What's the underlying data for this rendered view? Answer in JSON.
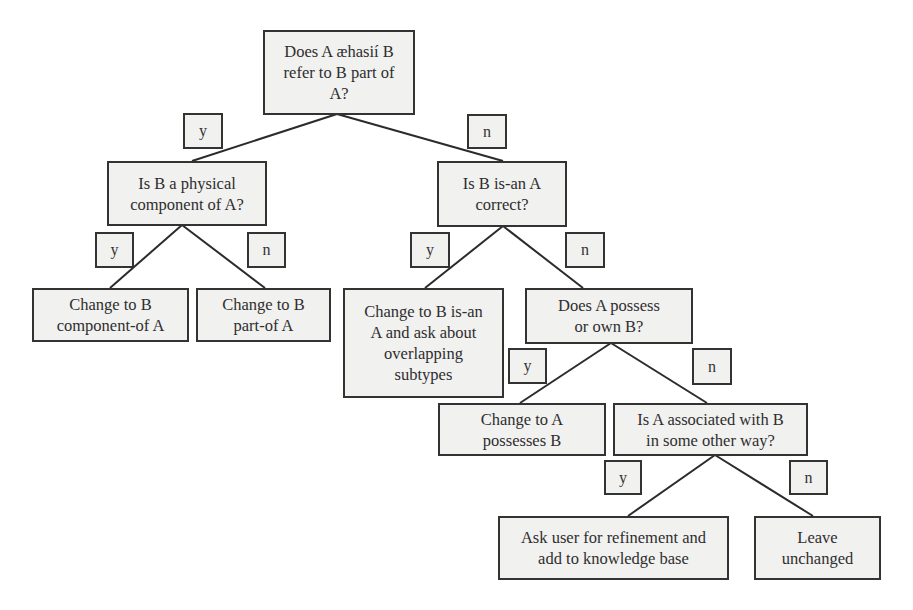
{
  "diagram": {
    "type": "decision-tree",
    "nodes": {
      "root": {
        "text": "Does A æhasií B\nrefer to B part of\nA?",
        "kind": "question"
      },
      "physical": {
        "text": "Is B a physical\ncomponent of A?",
        "kind": "question"
      },
      "isan": {
        "text": "Is B is-an A\ncorrect?",
        "kind": "question"
      },
      "component_of": {
        "text": "Change to B\ncomponent-of A",
        "kind": "action"
      },
      "part_of": {
        "text": "Change to B\npart-of A",
        "kind": "action"
      },
      "change_isan": {
        "text": "Change to B is-an\nA and ask about\noverlapping\nsubtypes",
        "kind": "action"
      },
      "possess": {
        "text": "Does A possess\nor own B?",
        "kind": "question"
      },
      "possesses": {
        "text": "Change to A\npossesses B",
        "kind": "action"
      },
      "associated": {
        "text": "Is A associated with B\nin some other way?",
        "kind": "question"
      },
      "ask_user": {
        "text": "Ask user for refinement and\nadd to knowledge base",
        "kind": "action"
      },
      "leave": {
        "text": "Leave\nunchanged",
        "kind": "action"
      }
    },
    "edges": [
      {
        "from": "root",
        "to": "physical",
        "label": "y"
      },
      {
        "from": "root",
        "to": "isan",
        "label": "n"
      },
      {
        "from": "physical",
        "to": "component_of",
        "label": "y"
      },
      {
        "from": "physical",
        "to": "part_of",
        "label": "n"
      },
      {
        "from": "isan",
        "to": "change_isan",
        "label": "y"
      },
      {
        "from": "isan",
        "to": "possess",
        "label": "n"
      },
      {
        "from": "possess",
        "to": "possesses",
        "label": "y"
      },
      {
        "from": "possess",
        "to": "associated",
        "label": "n"
      },
      {
        "from": "associated",
        "to": "ask_user",
        "label": "y"
      },
      {
        "from": "associated",
        "to": "leave",
        "label": "n"
      }
    ],
    "labels": {
      "yes": "y",
      "no": "n"
    }
  }
}
